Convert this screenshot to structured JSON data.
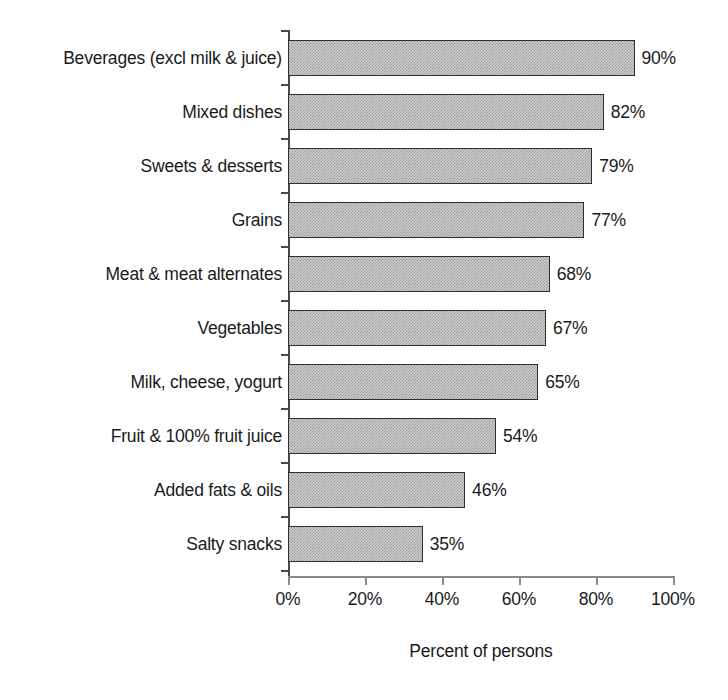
{
  "chart_data": {
    "type": "bar",
    "orientation": "horizontal",
    "title": "",
    "xlabel": "Percent of persons",
    "ylabel": "",
    "xlim": [
      0,
      100
    ],
    "xticks": [
      0,
      20,
      40,
      60,
      80,
      100
    ],
    "xtick_labels": [
      "0%",
      "20%",
      "40%",
      "60%",
      "80%",
      "100%"
    ],
    "grid": false,
    "legend": false,
    "value_label_suffix": "%",
    "categories": [
      "Beverages (excl milk & juice)",
      "Mixed dishes",
      "Sweets & desserts",
      "Grains",
      "Meat & meat alternates",
      "Vegetables",
      "Milk, cheese, yogurt",
      "Fruit & 100%  fruit juice",
      "Added fats & oils",
      "Salty snacks"
    ],
    "values": [
      90,
      82,
      79,
      77,
      68,
      67,
      65,
      54,
      46,
      35
    ],
    "value_labels": [
      "90%",
      "82%",
      "79%",
      "77%",
      "68%",
      "67%",
      "65%",
      "54%",
      "46%",
      "35%"
    ],
    "colors": {
      "bar_fill": "#cfcfcf",
      "bar_dither": "#9a9a9a",
      "bar_border": "#2e2e2e",
      "axis": "#4a4a4a",
      "x_axis": "#8a8a8a",
      "text": "#1a1a1a",
      "background": "#ffffff"
    }
  }
}
